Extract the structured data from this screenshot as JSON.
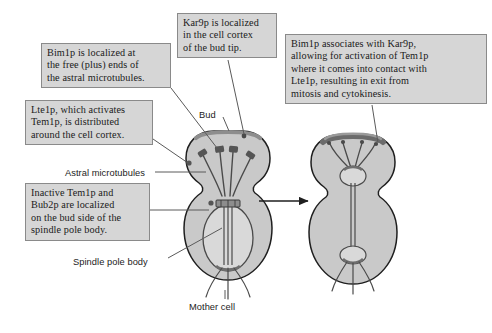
{
  "figure": {
    "type": "biological-diagram",
    "background_color": "#ffffff",
    "cell_fill": "#c9c9c9",
    "cell_stroke": "#1f1f1f",
    "cortex_color": "#8d8d8d",
    "box_fill": "#d6d6d6",
    "box_border": "#8a8a8a",
    "text_color": "#1a1a1a"
  },
  "callouts": [
    {
      "id": "bim1p",
      "lines": [
        "Bim1p is localized at",
        "the free (plus) ends of",
        "the astral microtubules."
      ]
    },
    {
      "id": "kar9p",
      "lines": [
        "Kar9p is localized",
        "in the cell cortex",
        "of the bud tip."
      ]
    },
    {
      "id": "bim1p_assoc",
      "lines": [
        "Bim1p associates with Kar9p,",
        "allowing for activation of Tem1p",
        "where it comes into contact with",
        "Lte1p, resulting in exit from",
        "mitosis and cytokinesis."
      ]
    },
    {
      "id": "lte1p",
      "lines": [
        "Lte1p, which activates",
        "Tem1p, is distributed",
        "around the cell cortex."
      ]
    },
    {
      "id": "inactive_tem1p",
      "lines": [
        "Inactive Tem1p and",
        "Bub2p are localized",
        "on the bud side of the",
        "spindle pole body."
      ]
    }
  ],
  "labels": {
    "bud": "Bud",
    "astral_microtubules": "Astral microtubules",
    "spindle_pole_body": "Spindle pole body",
    "mother_cell": "Mother cell"
  },
  "panels": [
    {
      "id": "left-cell",
      "stage": "before",
      "description": "Budded yeast cell with short mitotic spindle in mother cell and astral microtubules reaching bud tip cortex"
    },
    {
      "id": "right-cell",
      "stage": "after",
      "description": "Budded yeast cell with elongated anaphase spindle spanning mother and bud, nucleus divided"
    }
  ],
  "arrow": {
    "direction": "right",
    "label": ""
  }
}
